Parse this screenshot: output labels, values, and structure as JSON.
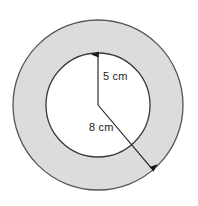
{
  "figure": {
    "background_color": "#ffffff",
    "width": 198,
    "height": 206
  },
  "shapes": {
    "outer_circle": {
      "name": "outer-circle",
      "center_x": 98,
      "center_y": 105,
      "radius": 85,
      "fill_color": "#dcdcdc",
      "stroke_color": "#555555"
    },
    "inner_circle": {
      "name": "inner-circle",
      "center_x": 98,
      "center_y": 105,
      "radius": 52,
      "fill_color": "#ffffff",
      "stroke_color": "#3a3a3a"
    },
    "center_point": {
      "x": 98,
      "y": 105
    }
  },
  "measurements": [
    {
      "id": "inner-radius",
      "label": "5 cm",
      "value": 5,
      "unit": "cm",
      "describes": "inner radius",
      "arrow_from_x": 98,
      "arrow_from_y": 105,
      "arrow_to_x": 98,
      "arrow_to_y": 53
    },
    {
      "id": "outer-radius",
      "label": "8 cm",
      "value": 8,
      "unit": "cm",
      "describes": "outer radius",
      "arrow_from_x": 98,
      "arrow_from_y": 105,
      "arrow_to_x": 153,
      "arrow_to_y": 170
    }
  ],
  "labels": {
    "inner_radius_text": "5 cm",
    "outer_radius_text": "8 cm"
  },
  "chart_data": {
    "type": "diagram",
    "shape": "annulus",
    "title": "",
    "annotations": [
      {
        "text": "5 cm",
        "refers_to": "inner radius",
        "value": 5,
        "unit": "cm"
      },
      {
        "text": "8 cm",
        "refers_to": "outer radius",
        "value": 8,
        "unit": "cm"
      }
    ],
    "values": [
      5,
      8
    ],
    "categories": [
      "inner radius",
      "outer radius"
    ],
    "xlabel": "",
    "ylabel": ""
  }
}
